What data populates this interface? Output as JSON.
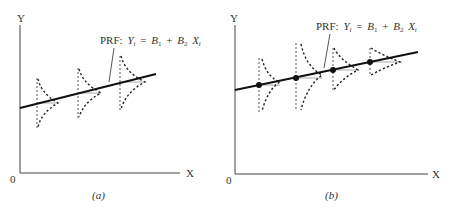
{
  "panels": [
    {
      "id": "a",
      "caption": "(a)",
      "y_axis_label": "Y",
      "x_axis_label": "X",
      "origin_label": "0",
      "line_label": {
        "prefix": "PRF:",
        "Y": "Y",
        "Y_sub": "i",
        "eq": "=",
        "B1": "B",
        "B1_sub": "1",
        "plus": "+",
        "B2": "B",
        "B2_sub": "2",
        "X": "X",
        "X_sub": "i"
      },
      "description": "Conditional distributions of Y with equal variance (homoscedastic) around the population regression function"
    },
    {
      "id": "b",
      "caption": "(b)",
      "y_axis_label": "Y",
      "x_axis_label": "X",
      "origin_label": "0",
      "line_label": {
        "prefix": "PRF:",
        "Y": "Y",
        "Y_sub": "i",
        "eq": "=",
        "B1": "B",
        "B1_sub": "1",
        "plus": "+",
        "B2": "B",
        "B2_sub": "2",
        "X": "X",
        "X_sub": "i"
      },
      "description": "Conditional distributions of Y with varying variance (heteroscedastic) around the population regression function, with mean points marked"
    }
  ]
}
